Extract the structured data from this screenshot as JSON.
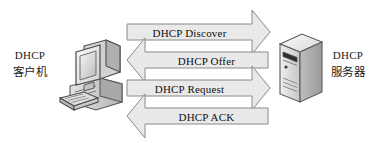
{
  "figure": {
    "width": 374,
    "height": 143,
    "background": "#ffffff"
  },
  "nodes": {
    "client": {
      "name": "dhcp-client",
      "line1": "DHCP",
      "line2": "客户机",
      "icon": "desktop-computer-icon",
      "position": "left"
    },
    "server": {
      "name": "dhcp-server",
      "line1": "DHCP",
      "line2": "服务器",
      "icon": "server-tower-icon",
      "position": "right"
    }
  },
  "messages": [
    {
      "label": "DHCP Discover",
      "direction": "client-to-server",
      "order": 1,
      "band_top": 24,
      "band_height": 16
    },
    {
      "label": "DHCP Offer",
      "direction": "server-to-client",
      "order": 2,
      "band_top": 52,
      "band_height": 16
    },
    {
      "label": "DHCP Request",
      "direction": "client-to-server",
      "order": 3,
      "band_top": 80,
      "band_height": 16
    },
    {
      "label": "DHCP ACK",
      "direction": "server-to-client",
      "order": 4,
      "band_top": 108,
      "band_height": 16
    }
  ],
  "colors": {
    "arrow_fill": "#e9e9e9",
    "arrow_stroke": "#888888",
    "text": "#111111",
    "icon_light": "#f2f2f2",
    "icon_mid": "#c9c9c9",
    "icon_dark": "#8d8d8d",
    "icon_outline": "#4a4a4a"
  }
}
